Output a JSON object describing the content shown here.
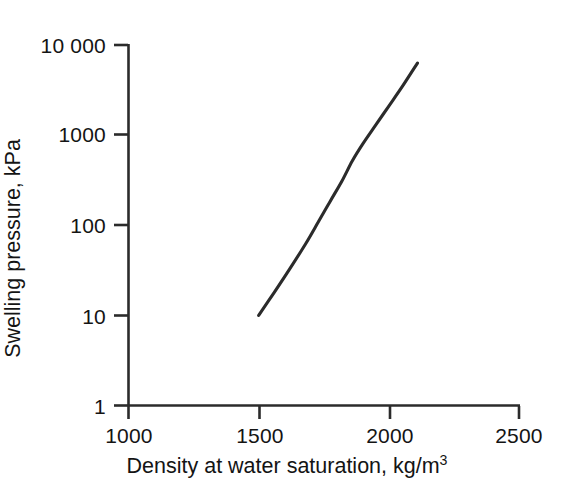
{
  "figure": {
    "background_color": "#ffffff",
    "line_color": "#2b2b2b",
    "axis_color": "#2b2b2b"
  },
  "chart_data": {
    "type": "line",
    "title": "",
    "subtitle": "",
    "xlabel_text": "Density at water saturation, kg/m",
    "xlabel_superscript": "3",
    "xlabel": "Density at water saturation, kg/m3",
    "ylabel": "Swelling pressure, kPa",
    "xscale": "linear",
    "yscale": "log",
    "xlim": [
      1000,
      2500
    ],
    "ylim": [
      1,
      10000
    ],
    "grid": false,
    "legend": "none",
    "xticks": [
      1000,
      1500,
      2000,
      2500
    ],
    "xtick_labels": [
      "1000",
      "1500",
      "2000",
      "2500"
    ],
    "yticks": [
      1,
      10,
      100,
      1000,
      10000
    ],
    "ytick_labels": [
      "1",
      "10",
      "100",
      "1000",
      "10 000"
    ],
    "series": [
      {
        "name": "swelling pressure curve",
        "x": [
          1500,
          1560,
          1620,
          1680,
          1730,
          1775,
          1820,
          1860,
          1900,
          1950,
          2000,
          2050,
          2110
        ],
        "y": [
          10,
          18,
          33,
          62,
          110,
          185,
          310,
          520,
          800,
          1300,
          2100,
          3400,
          6300
        ]
      }
    ],
    "annotations": []
  },
  "axes": {
    "x_axis_name": "x-axis",
    "y_axis_name": "y-axis"
  }
}
